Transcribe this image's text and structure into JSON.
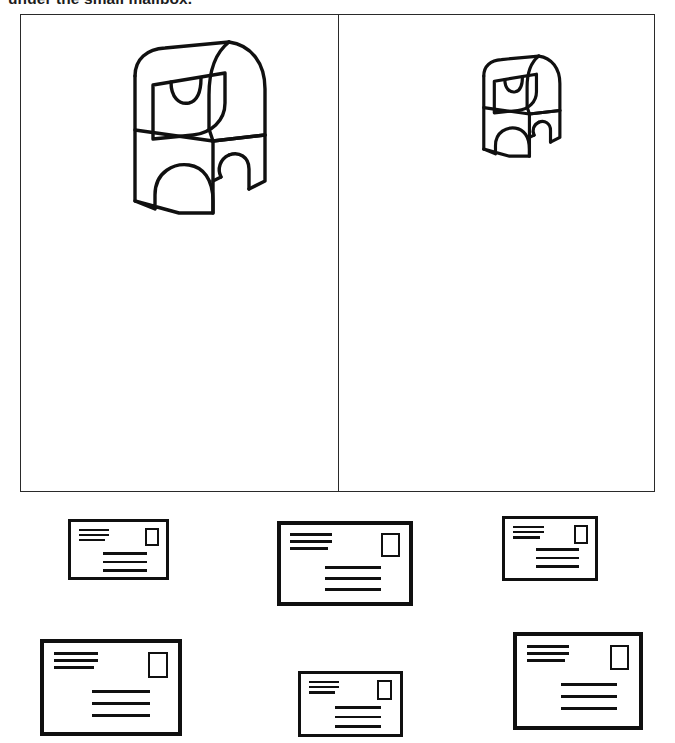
{
  "page": {
    "width": 675,
    "height": 743,
    "background_color": "#ffffff",
    "ink_color": "#101010"
  },
  "instruction": {
    "text": "under the small mailbox.",
    "note": "clipped at top edge of image"
  },
  "comparison_frame": {
    "border_color": "#2a2a2a",
    "panels": [
      {
        "id": "left-panel",
        "label": "large-mailbox-panel",
        "object": "mailbox",
        "size_descriptor": "big",
        "scale": 1.0
      },
      {
        "id": "right-panel",
        "label": "small-mailbox-panel",
        "object": "mailbox",
        "size_descriptor": "small",
        "scale": 0.56
      }
    ]
  },
  "envelopes": [
    {
      "id": "envelope-1",
      "row": 1,
      "column": 1,
      "size_descriptor": "small",
      "x": 68,
      "y": 519,
      "width": 101,
      "height": 61,
      "return_address_lines": 3,
      "address_lines": 3,
      "has_stamp": true
    },
    {
      "id": "envelope-2",
      "row": 1,
      "column": 2,
      "size_descriptor": "large",
      "x": 277,
      "y": 521,
      "width": 136,
      "height": 85,
      "return_address_lines": 3,
      "address_lines": 3,
      "has_stamp": true
    },
    {
      "id": "envelope-3",
      "row": 1,
      "column": 3,
      "size_descriptor": "medium",
      "x": 502,
      "y": 516,
      "width": 96,
      "height": 65,
      "return_address_lines": 3,
      "address_lines": 3,
      "has_stamp": true
    },
    {
      "id": "envelope-4",
      "row": 2,
      "column": 1,
      "size_descriptor": "large",
      "x": 40,
      "y": 639,
      "width": 142,
      "height": 97,
      "return_address_lines": 3,
      "address_lines": 3,
      "has_stamp": true
    },
    {
      "id": "envelope-5",
      "row": 2,
      "column": 2,
      "size_descriptor": "small",
      "x": 298,
      "y": 671,
      "width": 105,
      "height": 66,
      "return_address_lines": 3,
      "address_lines": 3,
      "has_stamp": true
    },
    {
      "id": "envelope-6",
      "row": 2,
      "column": 3,
      "size_descriptor": "large",
      "x": 513,
      "y": 632,
      "width": 130,
      "height": 98,
      "return_address_lines": 3,
      "address_lines": 3,
      "has_stamp": true
    }
  ]
}
